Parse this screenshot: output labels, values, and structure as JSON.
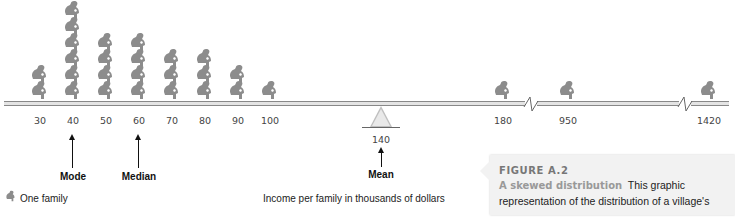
{
  "chart_data": {
    "type": "pictograph",
    "title": "A skewed distribution",
    "xlabel": "Income per family in thousands of dollars",
    "categories": [
      "30",
      "40",
      "50",
      "60",
      "70",
      "80",
      "90",
      "100",
      "180",
      "950",
      "1420"
    ],
    "values": [
      2,
      6,
      4,
      4,
      3,
      3,
      2,
      1,
      1,
      1,
      1
    ],
    "unit": "One family",
    "axis_breaks": [
      "between 180 and 950",
      "between 950 and 1420"
    ],
    "annotations": [
      {
        "label": "Mode",
        "x": 40
      },
      {
        "label": "Median",
        "x": 60
      },
      {
        "label": "Mean",
        "x": 140,
        "marker": "fulcrum"
      }
    ]
  },
  "ticks": [
    {
      "label": "30",
      "x": 40,
      "count": 2
    },
    {
      "label": "40",
      "x": 73,
      "count": 6
    },
    {
      "label": "50",
      "x": 106,
      "count": 4
    },
    {
      "label": "60",
      "x": 139,
      "count": 4
    },
    {
      "label": "70",
      "x": 172,
      "count": 3
    },
    {
      "label": "80",
      "x": 205,
      "count": 3
    },
    {
      "label": "90",
      "x": 238,
      "count": 2
    },
    {
      "label": "100",
      "x": 270,
      "count": 1
    },
    {
      "label": "180",
      "x": 503,
      "count": 1
    },
    {
      "label": "950",
      "x": 568,
      "count": 1
    },
    {
      "label": "1420",
      "x": 709,
      "count": 1
    }
  ],
  "annotations": {
    "mode": "Mode",
    "median": "Median",
    "mean": "Mean",
    "mean_value": "140"
  },
  "legend": {
    "label": "One family"
  },
  "axis_title": "Income per family in thousands of dollars",
  "caption": {
    "figure": "FIGURE A.2",
    "subtitle": "A skewed distribution",
    "body1": "This graphic",
    "body2": "representation of the distribution of a village's"
  },
  "colors": {
    "figure": "#8c8c8c",
    "beam": "#e4e4e4",
    "caption_bg": "#f2f2f2"
  }
}
